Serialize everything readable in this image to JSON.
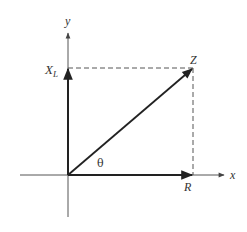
{
  "diagram": {
    "type": "impedance-triangle",
    "axes": {
      "x_label": "x",
      "y_label": "y"
    },
    "vectors": [
      {
        "id": "R",
        "label": "R",
        "description": "resistance along x-axis"
      },
      {
        "id": "XL",
        "label_main": "X",
        "label_sub": "L",
        "description": "inductive reactance along y-axis"
      },
      {
        "id": "Z",
        "label": "Z",
        "description": "impedance, resultant vector"
      }
    ],
    "angle_label": "θ",
    "colors": {
      "vector": "#222222",
      "axis": "#555555",
      "dashed": "#555555"
    }
  }
}
